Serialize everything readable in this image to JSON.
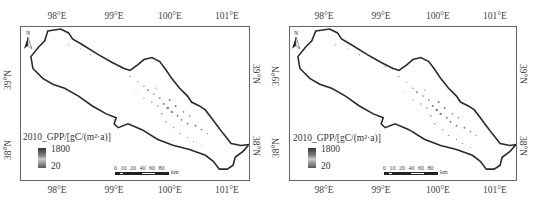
{
  "maps": [
    {
      "id": "left",
      "legend": {
        "title": "2010_GPP/[gC/(m²·a)]",
        "max": "1800",
        "min": "20"
      },
      "scale": {
        "labels": "0 10 20   40   60   80",
        "unit": "km"
      },
      "north_label": "N",
      "lon_ticks": [
        "98°E",
        "99°E",
        "100°E",
        "101°E"
      ],
      "lat_ticks": [
        "39°N",
        "38°N"
      ]
    },
    {
      "id": "right",
      "legend": {
        "title": "2010_GPP/[gC/(m²·a)]",
        "max": "1800",
        "min": "20"
      },
      "scale": {
        "labels": "0 10 20   40   60   80",
        "unit": "km"
      },
      "north_label": "N",
      "lon_ticks": [
        "98°E",
        "99°E",
        "100°E",
        "101°E"
      ],
      "lat_ticks": [
        "39°N",
        "38°N"
      ]
    }
  ],
  "colors": {
    "outline": "#2a2a2a",
    "frame": "#666666",
    "pixel_dark": "#444444",
    "pixel_light": "#aaaaaa"
  }
}
